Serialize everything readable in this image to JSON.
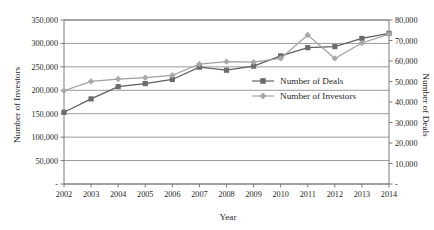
{
  "chart_data": {
    "type": "line",
    "title": "",
    "xlabel": "Year",
    "ylabel": "Number of Investors",
    "y2label": "Number of Deals",
    "categories": [
      "2002",
      "2003",
      "2004",
      "2005",
      "2006",
      "2007",
      "2008",
      "2009",
      "2010",
      "2011",
      "2012",
      "2013",
      "2014"
    ],
    "x_tick_labels": [
      "2002",
      "2003",
      "2004",
      "2005",
      "2006",
      "2007",
      "2008",
      "2009",
      "2010",
      "2011",
      "2012",
      "2013",
      "2014"
    ],
    "y_tick_labels": [
      "-",
      "50,000",
      "100,000",
      "150,000",
      "200,000",
      "250,000",
      "300,000",
      "350,000"
    ],
    "y_tick_values": [
      0,
      50000,
      100000,
      150000,
      200000,
      250000,
      300000,
      350000
    ],
    "y2_tick_labels": [
      "-",
      "10,000",
      "20,000",
      "30,000",
      "40,000",
      "50,000",
      "60,000",
      "70,000",
      "80,000"
    ],
    "y2_tick_values": [
      0,
      10000,
      20000,
      30000,
      40000,
      50000,
      60000,
      70000,
      80000
    ],
    "ylim": [
      0,
      350000
    ],
    "y2lim": [
      0,
      80000
    ],
    "grid": true,
    "legend_position": "center-right",
    "series": [
      {
        "name": "Number of Deals",
        "axis": "right",
        "marker": "square",
        "color": "#6b6b6b",
        "line_color": "#5e5e5e",
        "values": [
          35000,
          41500,
          47500,
          49000,
          51000,
          57000,
          55500,
          57500,
          62500,
          66500,
          67000,
          71000,
          73500
        ]
      },
      {
        "name": "Number of Investors",
        "axis": "left",
        "marker": "diamond",
        "color": "#a8a8a8",
        "line_color": "#a0a0a0",
        "values": [
          199000,
          219000,
          224000,
          227000,
          232000,
          256000,
          261000,
          260000,
          268000,
          318000,
          268000,
          301000,
          320000
        ]
      }
    ]
  },
  "legend": {
    "items": [
      {
        "label": "Number of Deals",
        "marker": "square",
        "color": "#6b6b6b"
      },
      {
        "label": "Number of Investors",
        "marker": "diamond",
        "color": "#a8a8a8"
      }
    ]
  },
  "colors": {
    "deals": "#6b6b6b",
    "investors": "#a8a8a8",
    "axis": "#6e6e6e",
    "grid": "#808080",
    "text": "#1f1f1f",
    "background": "#ffffff"
  }
}
